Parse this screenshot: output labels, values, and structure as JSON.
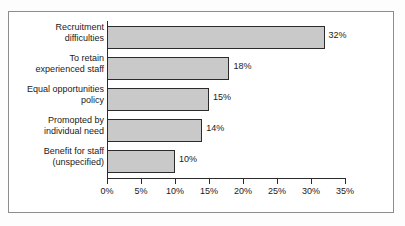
{
  "chart_data": {
    "type": "bar",
    "orientation": "horizontal",
    "title": "",
    "subtitle": "",
    "xlabel": "",
    "ylabel": "",
    "xlim": [
      0,
      35
    ],
    "grid": false,
    "legend": null,
    "value_suffix": "%",
    "axis_ticks": [
      "0%",
      "5%",
      "10%",
      "15%",
      "20%",
      "25%",
      "30%",
      "35%"
    ],
    "axis_tick_values": [
      0,
      5,
      10,
      15,
      20,
      25,
      30,
      35
    ],
    "categories": [
      "Recruitment\ndifficulties",
      "To retain\nexperienced staff",
      "Equal opportunities\npolicy",
      "Promopted by\nindividual need",
      "Benefit for staff\n(unspecified)"
    ],
    "values": [
      32,
      18,
      15,
      14,
      10
    ],
    "value_labels": [
      "32%",
      "18%",
      "15%",
      "14%",
      "10%"
    ],
    "colors": {
      "bar_fill": "#c9c9c9",
      "bar_border": "#2b2b2b",
      "axis": "#2b2b2b",
      "frame": "#8d8d8d",
      "text": "#1a1a1a",
      "background": "#ffffff"
    }
  }
}
